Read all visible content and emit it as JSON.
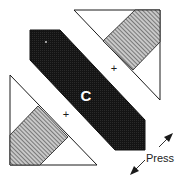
{
  "diagram": {
    "type": "quilt-block-assembly",
    "colors": {
      "outline": "#1a1a1a",
      "dark_fabric": "#1c1c1c",
      "stripe_fabric": "#9a9a9a",
      "background": "#ffffff",
      "label_on_dark": "#ffffff"
    },
    "center_piece": {
      "label": "C"
    },
    "seam_marks": [
      {
        "symbol": "+",
        "position": "upper-right"
      },
      {
        "symbol": "+",
        "position": "lower-left"
      }
    ],
    "press_instruction": {
      "label": "Press",
      "arrow": "double-arrow-diagonal"
    }
  }
}
